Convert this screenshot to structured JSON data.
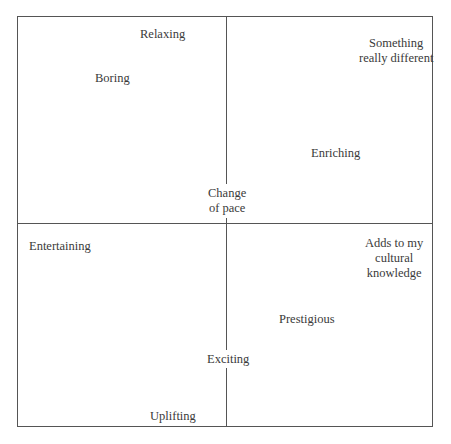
{
  "diagram": {
    "type": "quadrant-map",
    "axes": {
      "vertical_divider_x": 226,
      "horizontal_divider_y": 223
    },
    "labels": [
      {
        "id": "relaxing",
        "text": "Relaxing",
        "quadrant": "top-left"
      },
      {
        "id": "boring",
        "text": "Boring",
        "quadrant": "top-left"
      },
      {
        "id": "something-really-different",
        "text": "Something\nreally different",
        "lines": [
          "Something",
          "really different"
        ],
        "quadrant": "top-right"
      },
      {
        "id": "enriching",
        "text": "Enriching",
        "quadrant": "top-right"
      },
      {
        "id": "change-of-pace",
        "text": "Change\nof pace",
        "lines": [
          "Change",
          "of pace"
        ],
        "quadrant": "center"
      },
      {
        "id": "entertaining",
        "text": "Entertaining",
        "quadrant": "bottom-left"
      },
      {
        "id": "adds-to-my-cultural-knowledge",
        "text": "Adds to my\ncultural\nknowledge",
        "lines": [
          "Adds to my",
          "cultural",
          "knowledge"
        ],
        "quadrant": "bottom-right"
      },
      {
        "id": "prestigious",
        "text": "Prestigious",
        "quadrant": "bottom-right"
      },
      {
        "id": "exciting",
        "text": "Exciting",
        "quadrant": "center-bottom"
      },
      {
        "id": "uplifting",
        "text": "Uplifting",
        "quadrant": "bottom-left"
      }
    ]
  },
  "text": {
    "relaxing": "Relaxing",
    "boring": "Boring",
    "something_l1": "Something",
    "something_l2": "really different",
    "enriching": "Enriching",
    "change_l1": "Change",
    "change_l2": "of pace",
    "entertaining": "Entertaining",
    "adds_l1": "Adds to my",
    "adds_l2": "cultural",
    "adds_l3": "knowledge",
    "prestigious": "Prestigious",
    "exciting": "Exciting",
    "uplifting": "Uplifting"
  }
}
